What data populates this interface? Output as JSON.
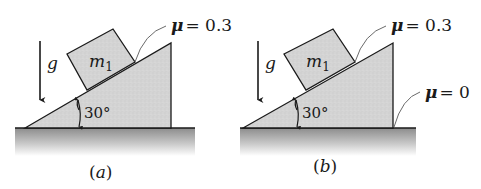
{
  "figure": {
    "panels": [
      {
        "id": "a",
        "caption": "(a)",
        "gravity_label": "g",
        "mass_label": "m",
        "mass_subscript": "1",
        "angle_label": "30°",
        "incline_friction": {
          "symbol": "μ",
          "value": "= 0.3"
        }
      },
      {
        "id": "b",
        "caption": "(b)",
        "gravity_label": "g",
        "mass_label": "m",
        "mass_subscript": "1",
        "angle_label": "30°",
        "incline_friction": {
          "symbol": "μ",
          "value": "= 0.3"
        },
        "ground_friction": {
          "symbol": "μ",
          "value": "= 0"
        }
      }
    ],
    "colors": {
      "wedge_fill": "#d6d6d6",
      "block_fill": "#d9d9d9",
      "stroke": "#1a1a1a",
      "ground_top": "#8a8a8a",
      "ground_bottom": "#ffffff",
      "leader": "#6a6a6a"
    }
  }
}
